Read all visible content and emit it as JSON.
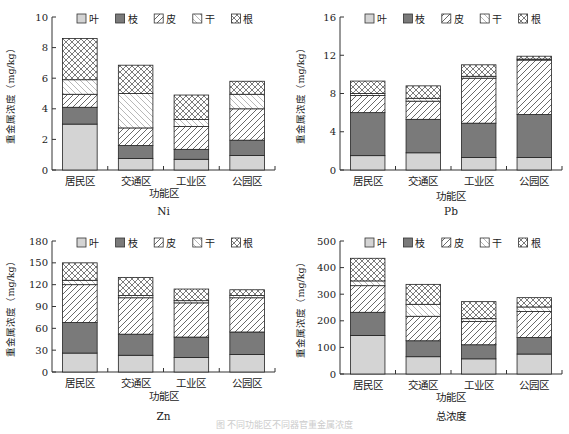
{
  "legend": [
    {
      "label": "叶",
      "pattern": "leaf"
    },
    {
      "label": "枝",
      "pattern": "branch"
    },
    {
      "label": "皮",
      "pattern": "bark"
    },
    {
      "label": "干",
      "pattern": "trunk"
    },
    {
      "label": "根",
      "pattern": "root"
    }
  ],
  "common": {
    "ylabel": "重金属浓度（mg/kg）",
    "xlabel": "功能区",
    "categories": [
      "居民区",
      "交通区",
      "工业区",
      "公园区"
    ]
  },
  "caption": "图 不同功能区不同器官重金属浓度",
  "chart_data": [
    {
      "type": "bar",
      "stacked": true,
      "title": "Ni",
      "xlabel": "功能区",
      "ylabel": "重金属浓度（mg/kg）",
      "categories": [
        "居民区",
        "交通区",
        "工业区",
        "公园区"
      ],
      "ylim": [
        0,
        10
      ],
      "yticks": [
        0,
        2,
        4,
        6,
        8,
        10
      ],
      "series": [
        {
          "name": "叶",
          "values": [
            3.0,
            0.75,
            0.7,
            0.95
          ]
        },
        {
          "name": "枝",
          "values": [
            1.1,
            0.85,
            0.65,
            1.0
          ]
        },
        {
          "name": "皮",
          "values": [
            0.85,
            1.15,
            1.5,
            2.05
          ]
        },
        {
          "name": "干",
          "values": [
            0.95,
            2.25,
            0.45,
            0.95
          ]
        },
        {
          "name": "根",
          "values": [
            2.7,
            1.85,
            1.6,
            0.85
          ]
        }
      ],
      "legend_position": "top"
    },
    {
      "type": "bar",
      "stacked": true,
      "title": "Pb",
      "xlabel": "功能区",
      "ylabel": "重金属浓度（mg/kg）",
      "categories": [
        "居民区",
        "交通区",
        "工业区",
        "公园区"
      ],
      "ylim": [
        0,
        16
      ],
      "yticks": [
        0,
        4,
        8,
        12,
        16
      ],
      "series": [
        {
          "name": "叶",
          "values": [
            1.5,
            1.8,
            1.3,
            1.3
          ]
        },
        {
          "name": "枝",
          "values": [
            4.5,
            3.5,
            3.6,
            4.5
          ]
        },
        {
          "name": "皮",
          "values": [
            1.8,
            1.9,
            4.7,
            5.7
          ]
        },
        {
          "name": "干",
          "values": [
            0.2,
            0.3,
            0.2,
            0.1
          ]
        },
        {
          "name": "根",
          "values": [
            1.3,
            1.3,
            1.2,
            0.3
          ]
        }
      ],
      "legend_position": "top"
    },
    {
      "type": "bar",
      "stacked": true,
      "title": "Zn",
      "xlabel": "功能区",
      "ylabel": "重金属浓度（mg/kg）",
      "categories": [
        "居民区",
        "交通区",
        "工业区",
        "公园区"
      ],
      "ylim": [
        0,
        180
      ],
      "yticks": [
        0,
        30,
        60,
        90,
        120,
        150,
        180
      ],
      "series": [
        {
          "name": "叶",
          "values": [
            26,
            23,
            20,
            24
          ]
        },
        {
          "name": "枝",
          "values": [
            42,
            29,
            28,
            31
          ]
        },
        {
          "name": "皮",
          "values": [
            52,
            50,
            47,
            47
          ]
        },
        {
          "name": "干",
          "values": [
            6,
            3,
            3,
            3
          ]
        },
        {
          "name": "根",
          "values": [
            24,
            25,
            16,
            8
          ]
        }
      ],
      "legend_position": "top"
    },
    {
      "type": "bar",
      "stacked": true,
      "title": "总浓度",
      "xlabel": "功能区",
      "ylabel": "重金属浓度（mg/kg）",
      "categories": [
        "居民区",
        "交通区",
        "工业区",
        "公园区"
      ],
      "ylim": [
        0,
        500
      ],
      "yticks": [
        0,
        100,
        200,
        300,
        400,
        500
      ],
      "series": [
        {
          "name": "叶",
          "values": [
            145,
            65,
            57,
            75
          ]
        },
        {
          "name": "枝",
          "values": [
            87,
            60,
            53,
            62
          ]
        },
        {
          "name": "皮",
          "values": [
            100,
            92,
            87,
            98
          ]
        },
        {
          "name": "干",
          "values": [
            18,
            45,
            11,
            17
          ]
        },
        {
          "name": "根",
          "values": [
            85,
            75,
            64,
            35
          ]
        }
      ],
      "legend_position": "top"
    }
  ]
}
